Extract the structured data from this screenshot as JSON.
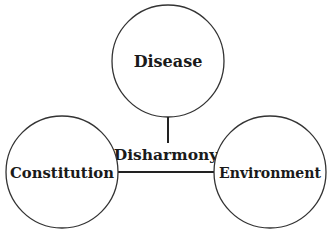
{
  "diagram": {
    "type": "concept-diagram",
    "colors": {
      "stroke": "#333333",
      "text": "#1a1a1a",
      "background": "#ffffff"
    },
    "nodes": [
      {
        "id": "disease",
        "label": "Disease",
        "cx": 168,
        "cy": 61,
        "r": 56
      },
      {
        "id": "constitution",
        "label": "Constitution",
        "cx": 62,
        "cy": 172,
        "r": 56
      },
      {
        "id": "environment",
        "label": "Environment",
        "cx": 270,
        "cy": 172,
        "r": 56
      }
    ],
    "center_label": "Disharmony",
    "edges": [
      {
        "from": "disease",
        "to": "center",
        "type": "vertical"
      },
      {
        "from": "constitution",
        "to": "environment",
        "type": "horizontal"
      }
    ]
  }
}
